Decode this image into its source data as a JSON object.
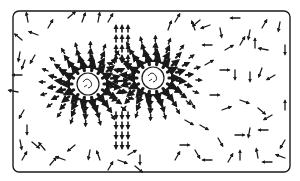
{
  "diagram": {
    "frame": {
      "x": 13,
      "y": 11,
      "w": 277,
      "h": 161,
      "rx": 6
    },
    "stroke_color": "#1a1a1a",
    "background": "#ffffff",
    "bodies": [
      {
        "name": "left-body",
        "cx": 88,
        "cy": 84,
        "r": 11
      },
      {
        "name": "right-body",
        "cx": 153,
        "cy": 78,
        "r": 11
      }
    ],
    "radial_fields": [
      {
        "body": 0,
        "rings": [
          16,
          24,
          33,
          43
        ],
        "count": 14,
        "lengths": [
          8,
          7,
          6,
          5
        ],
        "widths": [
          3.2,
          2.6,
          2.0,
          1.5
        ]
      },
      {
        "body": 1,
        "rings": [
          16,
          24,
          33,
          43
        ],
        "count": 14,
        "lengths": [
          8,
          7,
          6,
          5
        ],
        "widths": [
          3.2,
          2.6,
          2.0,
          1.5
        ]
      }
    ],
    "center_column": {
      "x": [
        116,
        122,
        128
      ],
      "up_y": [
        26,
        36,
        46,
        56
      ],
      "down_y": [
        112,
        122,
        132,
        142
      ],
      "length": 6
    },
    "random_arrows": [
      [
        28,
        22,
        260
      ],
      [
        48,
        28,
        300
      ],
      [
        68,
        18,
        320
      ],
      [
        82,
        22,
        290
      ],
      [
        98,
        22,
        280
      ],
      [
        108,
        22,
        300
      ],
      [
        22,
        40,
        220
      ],
      [
        38,
        35,
        200
      ],
      [
        20,
        52,
        100
      ],
      [
        25,
        60,
        110
      ],
      [
        35,
        55,
        120
      ],
      [
        22,
        75,
        180
      ],
      [
        18,
        92,
        190
      ],
      [
        24,
        110,
        120
      ],
      [
        27,
        125,
        90
      ],
      [
        20,
        140,
        80
      ],
      [
        32,
        142,
        40
      ],
      [
        22,
        160,
        300
      ],
      [
        45,
        150,
        230
      ],
      [
        50,
        165,
        310
      ],
      [
        65,
        160,
        200
      ],
      [
        75,
        145,
        140
      ],
      [
        90,
        150,
        100
      ],
      [
        100,
        160,
        250
      ],
      [
        108,
        170,
        300
      ],
      [
        118,
        160,
        20
      ],
      [
        128,
        155,
        330
      ],
      [
        135,
        166,
        40
      ],
      [
        140,
        155,
        90
      ],
      [
        168,
        30,
        290
      ],
      [
        175,
        22,
        300
      ],
      [
        195,
        30,
        250
      ],
      [
        200,
        20,
        140
      ],
      [
        210,
        25,
        160
      ],
      [
        220,
        28,
        80
      ],
      [
        240,
        18,
        180
      ],
      [
        250,
        30,
        100
      ],
      [
        262,
        28,
        300
      ],
      [
        280,
        22,
        100
      ],
      [
        285,
        45,
        90
      ],
      [
        212,
        45,
        180
      ],
      [
        225,
        50,
        330
      ],
      [
        240,
        45,
        300
      ],
      [
        255,
        48,
        270
      ],
      [
        268,
        50,
        190
      ],
      [
        205,
        65,
        330
      ],
      [
        220,
        70,
        0
      ],
      [
        235,
        70,
        90
      ],
      [
        250,
        72,
        90
      ],
      [
        262,
        68,
        110
      ],
      [
        275,
        75,
        150
      ],
      [
        210,
        95,
        0
      ],
      [
        222,
        110,
        340
      ],
      [
        240,
        100,
        20
      ],
      [
        258,
        108,
        40
      ],
      [
        272,
        115,
        150
      ],
      [
        285,
        110,
        270
      ],
      [
        200,
        125,
        30
      ],
      [
        218,
        138,
        60
      ],
      [
        235,
        135,
        0
      ],
      [
        250,
        128,
        100
      ],
      [
        268,
        130,
        180
      ],
      [
        285,
        140,
        120
      ],
      [
        195,
        150,
        60
      ],
      [
        212,
        160,
        180
      ],
      [
        228,
        162,
        300
      ],
      [
        240,
        160,
        270
      ],
      [
        258,
        158,
        260
      ],
      [
        272,
        162,
        180
      ],
      [
        285,
        158,
        200
      ],
      [
        180,
        145,
        0
      ],
      [
        175,
        160,
        300
      ],
      [
        190,
        100,
        60
      ],
      [
        185,
        120,
        30
      ]
    ]
  }
}
